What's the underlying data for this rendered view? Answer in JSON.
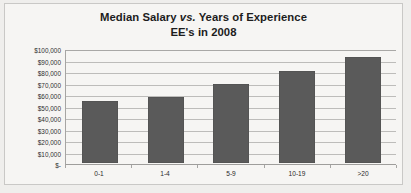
{
  "chart_data": {
    "type": "bar",
    "title": "Median Salary vs.  Years of Experience",
    "title_line1_pre": "Median Salary ",
    "title_line1_vs": "vs.",
    "title_line1_post": "  Years of Experience",
    "title_line2": "EE's in 2008",
    "xlabel": "",
    "ylabel": "",
    "categories": [
      "0-1",
      "1-4",
      "5-9",
      "10-19",
      ">20"
    ],
    "values": [
      54000,
      57500,
      69000,
      80000,
      92500
    ],
    "ylim": [
      0,
      100000
    ],
    "ytick_values": [
      100000,
      90000,
      80000,
      70000,
      60000,
      50000,
      40000,
      30000,
      20000,
      10000,
      0
    ],
    "ytick_labels": [
      "$100,000",
      "$90,000",
      "$80,000",
      "$70,000",
      "$60,000",
      "$50,000",
      "$40,000",
      "$30,000",
      "$20,000",
      "$10,000",
      "$-"
    ],
    "grid": true,
    "legend": false,
    "legend_position": "none",
    "bar_color": "#5a5a5a",
    "gridline_color": "#bdbcba",
    "background_color": "#f6f5f3",
    "border_color": "#c9c8c6"
  }
}
